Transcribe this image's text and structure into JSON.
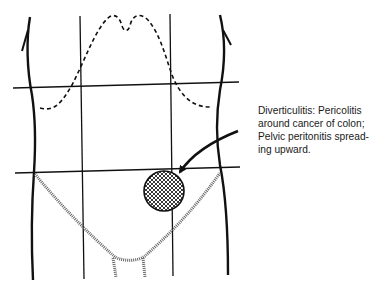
{
  "diagram": {
    "caption": {
      "lines": [
        "Diverticulitis:  Pericolitis",
        "around cancer of colon;",
        "Pelvic peritonitis spread-",
        "ing upward."
      ]
    },
    "legend": {
      "lesion": "Cross-hatched circle in left lower quadrant",
      "pelvic_area": "Hatched V-shaped pelvic region",
      "liver_outline": "Dashed upper abdominal outline"
    },
    "colors": {
      "ink": "#111111",
      "hatch": "#555555",
      "background": "#ffffff"
    }
  }
}
